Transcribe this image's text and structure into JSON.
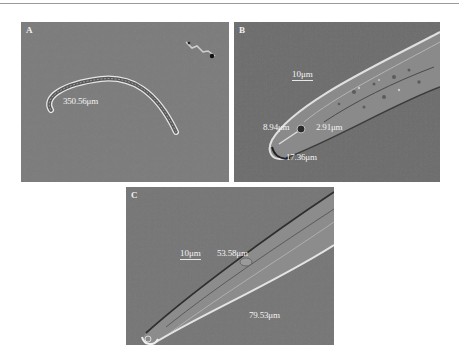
{
  "figure": {
    "panels": [
      {
        "label": "A",
        "measurements": [
          "350.56μm"
        ]
      },
      {
        "label": "B",
        "scale_bar": "10μm",
        "measurements": [
          "8.94μm",
          "2.91μm",
          "17.36μm"
        ]
      },
      {
        "label": "C",
        "scale_bar": "10μm",
        "measurements": [
          "53.58μm",
          "79.53μm"
        ]
      }
    ]
  }
}
